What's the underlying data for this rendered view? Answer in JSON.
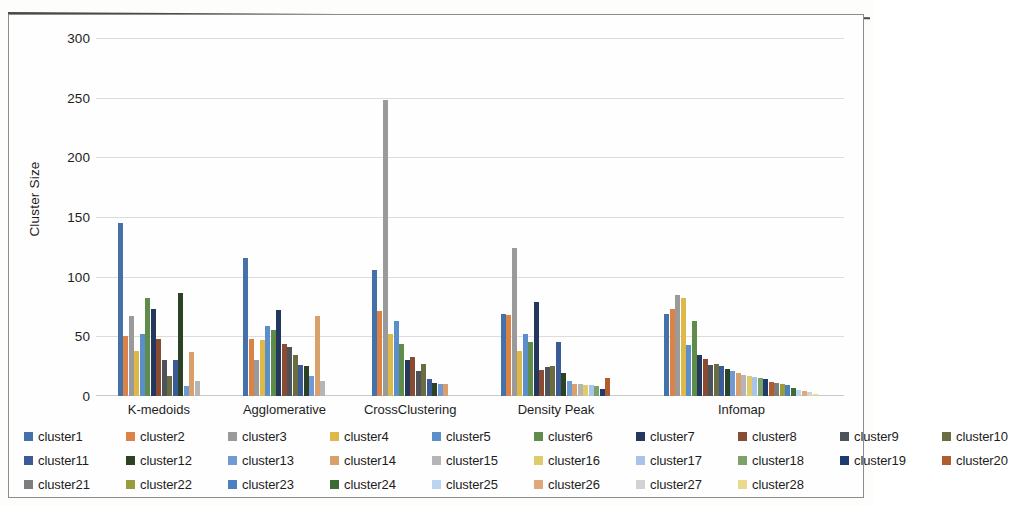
{
  "chart_data": {
    "type": "bar",
    "title": "",
    "xlabel": "",
    "ylabel": "Cluster Size",
    "ylim": [
      0,
      300
    ],
    "yticks": [
      0,
      50,
      100,
      150,
      200,
      250,
      300
    ],
    "grid": true,
    "legend_position": "bottom",
    "categories": [
      "K-medoids",
      "Agglomerative",
      "CrossClustering",
      "Density Peak",
      "Infomap"
    ],
    "series": [
      {
        "name": "cluster1",
        "color": "#4472a8",
        "values": [
          145,
          116,
          106,
          69,
          69
        ]
      },
      {
        "name": "cluster2",
        "color": "#dd8247",
        "values": [
          50,
          48,
          71,
          68,
          73
        ]
      },
      {
        "name": "cluster3",
        "color": "#9a9a9a",
        "values": [
          67,
          30,
          248,
          124,
          85
        ]
      },
      {
        "name": "cluster4",
        "color": "#dfb84a",
        "values": [
          38,
          47,
          52,
          38,
          82
        ]
      },
      {
        "name": "cluster5",
        "color": "#5b8fc9",
        "values": [
          52,
          59,
          63,
          52,
          43
        ]
      },
      {
        "name": "cluster6",
        "color": "#5f8c4a",
        "values": [
          82,
          55,
          44,
          45,
          63
        ]
      },
      {
        "name": "cluster7",
        "color": "#24385e",
        "values": [
          73,
          72,
          30,
          79,
          34
        ]
      },
      {
        "name": "cluster8",
        "color": "#8a4b33",
        "values": [
          48,
          44,
          33,
          22,
          31
        ]
      },
      {
        "name": "cluster9",
        "color": "#4d5359",
        "values": [
          30,
          41,
          21,
          24,
          26
        ]
      },
      {
        "name": "cluster10",
        "color": "#6b6c3f",
        "values": [
          17,
          34,
          27,
          25,
          27
        ]
      },
      {
        "name": "cluster11",
        "color": "#3b5b96",
        "values": [
          30,
          26,
          14,
          45,
          25
        ]
      },
      {
        "name": "cluster12",
        "color": "#2c4224",
        "values": [
          86,
          25,
          11,
          19,
          23
        ]
      },
      {
        "name": "cluster13",
        "color": "#6f9ad6",
        "values": [
          8,
          17,
          10,
          13,
          21
        ]
      },
      {
        "name": "cluster14",
        "color": "#d9a06b",
        "values": [
          37,
          67,
          10,
          10,
          19
        ]
      },
      {
        "name": "cluster15",
        "color": "#b5b5b5",
        "values": [
          13,
          13,
          null,
          10,
          18
        ]
      },
      {
        "name": "cluster16",
        "color": "#e0cb6c",
        "values": [
          null,
          null,
          null,
          9,
          17
        ]
      },
      {
        "name": "cluster17",
        "color": "#a8c4e8",
        "values": [
          null,
          null,
          null,
          9,
          16
        ]
      },
      {
        "name": "cluster18",
        "color": "#7ba368",
        "values": [
          null,
          null,
          null,
          8,
          15
        ]
      },
      {
        "name": "cluster19",
        "color": "#1f3a6e",
        "values": [
          null,
          null,
          null,
          6,
          14
        ]
      },
      {
        "name": "cluster20",
        "color": "#b15c2e",
        "values": [
          null,
          null,
          null,
          15,
          12
        ]
      },
      {
        "name": "cluster21",
        "color": "#7d7d7d",
        "values": [
          null,
          null,
          null,
          null,
          11
        ]
      },
      {
        "name": "cluster22",
        "color": "#9a9b3c",
        "values": [
          null,
          null,
          null,
          null,
          10
        ]
      },
      {
        "name": "cluster23",
        "color": "#4a7fc1",
        "values": [
          null,
          null,
          null,
          null,
          9
        ]
      },
      {
        "name": "cluster24",
        "color": "#3e6b35",
        "values": [
          null,
          null,
          null,
          null,
          7
        ]
      },
      {
        "name": "cluster25",
        "color": "#bcd4ef",
        "values": [
          null,
          null,
          null,
          null,
          5
        ]
      },
      {
        "name": "cluster26",
        "color": "#e0a878",
        "values": [
          null,
          null,
          null,
          null,
          4
        ]
      },
      {
        "name": "cluster27",
        "color": "#d2d2d2",
        "values": [
          null,
          null,
          null,
          null,
          3
        ]
      },
      {
        "name": "cluster28",
        "color": "#ead98f",
        "values": [
          null,
          null,
          null,
          null,
          2
        ]
      }
    ]
  }
}
